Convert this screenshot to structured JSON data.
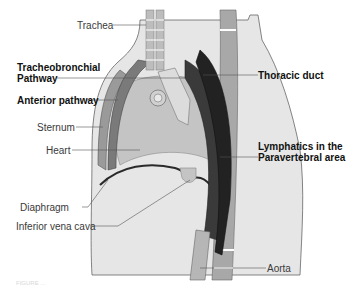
{
  "figure": {
    "labels": {
      "trachea": "Trachea",
      "tracheobronchial_line1": "Tracheobronchial",
      "tracheobronchial_line2": "Pathway",
      "anterior_pathway": "Anterior pathway",
      "sternum": "Sternum",
      "heart": "Heart",
      "diaphragm": "Diaphragm",
      "inferior_vena_cava": "Inferior vena cava",
      "thoracic_duct": "Thoracic duct",
      "lymphatics_line1": "Lymphatics in the",
      "lymphatics_line2": "Paravertebral area",
      "aorta": "Aorta"
    },
    "caption": "FIGURE ...",
    "colors": {
      "body": "#e6e6e6",
      "heart": "#c4c4c4",
      "sternum": "#9a9a9a",
      "anterior_pathway": "#7a7a7a",
      "vertebra": "#a8a8a8",
      "thoracic_duct": "#3a3a3a",
      "leader_line": "#555555"
    }
  }
}
